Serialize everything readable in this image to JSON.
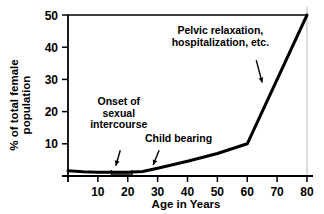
{
  "chart_data": {
    "type": "line",
    "title": "",
    "xlabel": "Age in Years",
    "ylabel": "% of total female population",
    "ylabel_line1": "% of total female",
    "ylabel_line2": "population",
    "xlim": [
      0,
      80
    ],
    "ylim": [
      0,
      50
    ],
    "grid": false,
    "legend": "none",
    "xticks": [
      10,
      20,
      30,
      40,
      50,
      60,
      70,
      80
    ],
    "xtick_labels": [
      "10",
      "20",
      "30",
      "40",
      "50",
      "60",
      "70",
      "80"
    ],
    "yticks": [
      10,
      20,
      30,
      40,
      50
    ],
    "ytick_labels": [
      "10",
      "20",
      "30",
      "40",
      "50"
    ],
    "series": [
      {
        "name": "% of total female population",
        "color": "#000000",
        "x": [
          0,
          5,
          10,
          15,
          20,
          25,
          30,
          40,
          50,
          60,
          80
        ],
        "y": [
          1.6,
          1.3,
          1.2,
          1.2,
          1.2,
          1.4,
          2.4,
          4.6,
          7.0,
          10.0,
          50.0
        ]
      }
    ],
    "annotations": [
      {
        "id": "onset-of-sexual-intercourse",
        "text_lines": [
          "Onset of",
          "sexual",
          "intercourse"
        ],
        "text_x": 17,
        "text_y": 22,
        "arrow_from_x": 17.5,
        "arrow_from_y": 8.0,
        "arrow_to_x": 16.0,
        "arrow_to_y": 3.2,
        "bracket_x_start": 14.5,
        "bracket_x_end": 21.5,
        "bracket_y": 0.6
      },
      {
        "id": "child-bearing",
        "text_lines": [
          "Child bearing"
        ],
        "text_x": 37,
        "text_y": 10.5,
        "arrow_from_x": 30.5,
        "arrow_from_y": 8.0,
        "arrow_to_x": 28.5,
        "arrow_to_y": 3.4
      },
      {
        "id": "pelvic-relaxation-hospitalization",
        "text_lines": [
          "Pelvic relaxation,",
          "hospitalization, etc."
        ],
        "text_x": 51,
        "text_y": 44,
        "arrow_from_x": 63.0,
        "arrow_from_y": 36.0,
        "arrow_to_x": 65.0,
        "arrow_to_y": 29.0
      }
    ],
    "axis_color": "#000000",
    "line_color": "#000000",
    "background": "#ffffff",
    "border_color": "#b8b8b8"
  }
}
